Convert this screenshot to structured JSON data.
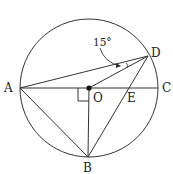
{
  "diagram": {
    "type": "circle-geometry",
    "circle": {
      "center": "O"
    },
    "points": {
      "A": "A",
      "B": "B",
      "C": "C",
      "D": "D",
      "E": "E",
      "O": "O"
    },
    "angle_label": "15°",
    "annotations": {
      "right_angle_at": "O",
      "angle_marked": "ADO"
    },
    "segments": [
      "AC",
      "AD",
      "AB",
      "OD",
      "OB",
      "BD"
    ]
  }
}
